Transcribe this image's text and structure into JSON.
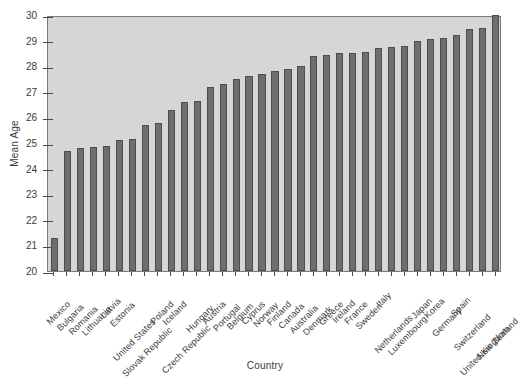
{
  "chart_data": {
    "type": "bar",
    "title": "",
    "xlabel": "Country",
    "ylabel": "Mean Age",
    "ylim": [
      20,
      30
    ],
    "yticks": [
      20,
      21,
      22,
      23,
      24,
      25,
      26,
      27,
      28,
      29,
      30
    ],
    "grid": false,
    "legend": null,
    "categories": [
      "Mexico",
      "Bulgaria",
      "Romania",
      "Lithuania",
      "Latvia",
      "Estonia",
      "United States",
      "Slovak Republic",
      "Poland",
      "Iceland",
      "Czech Republic",
      "Hungary",
      "Austria",
      "Portugal",
      "Belgium",
      "Cyprus",
      "Norway",
      "Finland",
      "Canada",
      "Australia",
      "Denmark",
      "Greece",
      "Ireland",
      "France",
      "Sweden",
      "Italy",
      "Netherlands",
      "Luxembourg",
      "Japan",
      "Korea",
      "Germany",
      "Spain",
      "Switzerland",
      "United Kingdom",
      "New Zealand"
    ],
    "values": [
      21.3,
      24.7,
      24.8,
      24.85,
      24.9,
      25.1,
      25.15,
      25.7,
      25.8,
      26.3,
      26.6,
      26.65,
      27.2,
      27.3,
      27.5,
      27.6,
      27.7,
      27.8,
      27.9,
      28.0,
      28.4,
      28.45,
      28.5,
      28.5,
      28.55,
      28.7,
      28.75,
      28.8,
      29.0,
      29.05,
      29.1,
      29.2,
      29.45,
      29.5,
      30.0
    ],
    "bar_color": "#6e6e6e",
    "bar_edge_color": "#4d4d4d",
    "plot_background": "#d6d6d6",
    "axis_color": "#4a4a4a"
  }
}
